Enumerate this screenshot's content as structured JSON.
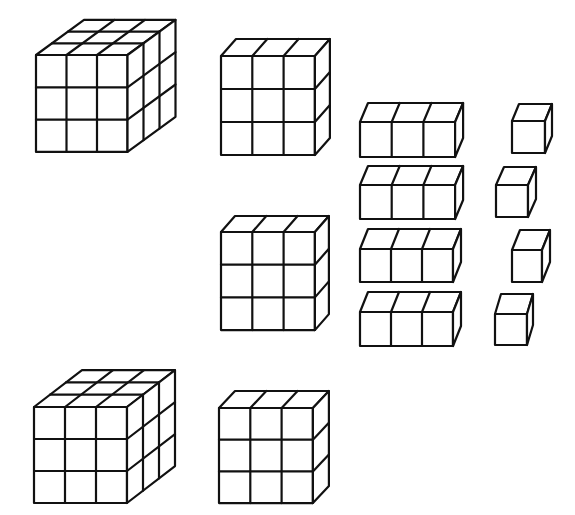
{
  "diagram": {
    "title": "",
    "stroke_color": "#111111",
    "fill_color": "#ffffff",
    "stroke_width": 2.2,
    "shapes": [
      {
        "name": "large-cube-1",
        "kind": "cube-3x3x3",
        "x": 36,
        "y": 55,
        "cols": 3,
        "rows": 3,
        "depth": 3,
        "cw": 30.5,
        "ch": 32.3,
        "dx": 16,
        "dy": -11.7
      },
      {
        "name": "flat-1",
        "kind": "flat-3x3x1",
        "x": 221,
        "y": 56,
        "cols": 3,
        "rows": 3,
        "depth": 1,
        "cw": 31.3,
        "ch": 33,
        "dx": 15,
        "dy": -17
      },
      {
        "name": "flat-2",
        "kind": "flat-3x3x1",
        "x": 221,
        "y": 232,
        "cols": 3,
        "rows": 3,
        "depth": 1,
        "cw": 31.3,
        "ch": 32.7,
        "dx": 14,
        "dy": -16
      },
      {
        "name": "rod-1",
        "kind": "rod-3x1x1",
        "x": 360,
        "y": 122,
        "cols": 3,
        "rows": 1,
        "depth": 1,
        "cw": 31.7,
        "ch": 35,
        "dx": 8,
        "dy": -19
      },
      {
        "name": "rod-2",
        "kind": "rod-3x1x1",
        "x": 360,
        "y": 185,
        "cols": 3,
        "rows": 1,
        "depth": 1,
        "cw": 31.7,
        "ch": 34,
        "dx": 8,
        "dy": -19
      },
      {
        "name": "rod-3",
        "kind": "rod-3x1x1",
        "x": 360,
        "y": 249,
        "cols": 3,
        "rows": 1,
        "depth": 1,
        "cw": 31,
        "ch": 33,
        "dx": 8,
        "dy": -20
      },
      {
        "name": "rod-4",
        "kind": "rod-3x1x1",
        "x": 360,
        "y": 312,
        "cols": 3,
        "rows": 1,
        "depth": 1,
        "cw": 31,
        "ch": 34,
        "dx": 8,
        "dy": -20
      },
      {
        "name": "unit-1",
        "kind": "unit-1x1x1",
        "x": 512,
        "y": 121,
        "cols": 1,
        "rows": 1,
        "depth": 1,
        "cw": 33,
        "ch": 32,
        "dx": 7,
        "dy": -17
      },
      {
        "name": "unit-2",
        "kind": "unit-1x1x1",
        "x": 496,
        "y": 185,
        "cols": 1,
        "rows": 1,
        "depth": 1,
        "cw": 32,
        "ch": 32,
        "dx": 8,
        "dy": -18
      },
      {
        "name": "unit-3",
        "kind": "unit-1x1x1",
        "x": 512,
        "y": 250,
        "cols": 1,
        "rows": 1,
        "depth": 1,
        "cw": 30,
        "ch": 32,
        "dx": 8,
        "dy": -20
      },
      {
        "name": "unit-4",
        "kind": "unit-1x1x1",
        "x": 495,
        "y": 314,
        "cols": 1,
        "rows": 1,
        "depth": 1,
        "cw": 32,
        "ch": 31,
        "dx": 6,
        "dy": -20
      },
      {
        "name": "large-cube-2",
        "kind": "cube-3x3x3",
        "x": 34,
        "y": 407,
        "cols": 3,
        "rows": 3,
        "depth": 3,
        "cw": 31,
        "ch": 32,
        "dx": 16,
        "dy": -12.3
      },
      {
        "name": "flat-3",
        "kind": "flat-3x3x1",
        "x": 219,
        "y": 408,
        "cols": 3,
        "rows": 3,
        "depth": 1,
        "cw": 31.3,
        "ch": 31.7,
        "dx": 16,
        "dy": -17
      }
    ]
  }
}
